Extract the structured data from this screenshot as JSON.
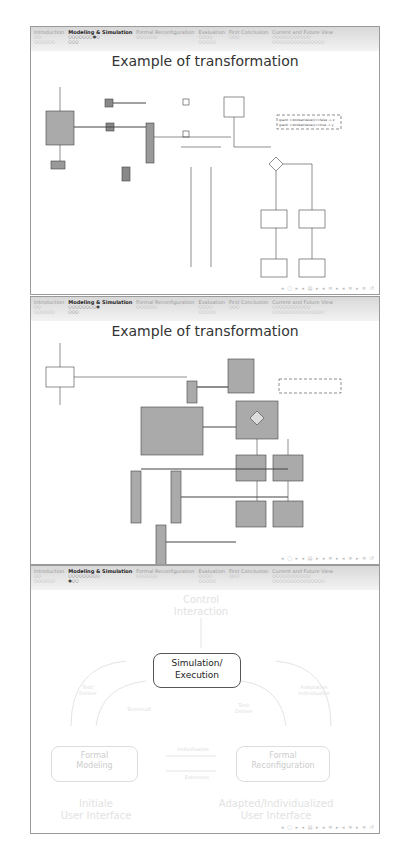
{
  "sections": [
    {
      "label": "Introduction",
      "dots": [
        "○○",
        "○○○○○○"
      ]
    },
    {
      "label": "Modeling & Simulation",
      "dots": [
        "○○○○○○○○",
        "○○○"
      ]
    },
    {
      "label": "Formal Reconfiguration",
      "dots": [
        "○○○○○○"
      ]
    },
    {
      "label": "Evaluation",
      "dots": [
        "○○○○",
        "○○○○○"
      ]
    },
    {
      "label": "First Conclusion",
      "dots": [
        "○○○"
      ]
    },
    {
      "label": "Current and Future View",
      "dots": [
        "○○○○○○○○○○○",
        "○○○○○○○○○○○○○○○"
      ]
    }
  ],
  "slides": [
    {
      "active_section": "Modeling & Simulation",
      "active_dots": [
        "○○○○○○○●○",
        "○○○"
      ],
      "title": "Example of transformation",
      "nav": "◂ ▢ ▸ ◂ ▤ ▸ ◂ ≡ ▸ ◂ ≡ ▸ ≡ ↺"
    },
    {
      "active_section": "Modeling & Simulation",
      "active_dots": [
        "○○○○○○○○●",
        "○○○"
      ],
      "title": "Example of transformation",
      "nav": "◂ ▢ ▸ ◂ ▤ ▸ ◂ ≡ ▸ ◂ ≡ ▸ ≡ ↺"
    },
    {
      "active_section": "Modeling & Simulation",
      "active_dots": [
        "○○○○○○○○○",
        "●○○"
      ],
      "cycle": {
        "control": "Control\nInteraction",
        "center": "Simulation/\nExecution",
        "test_deliver_left": "Test/\nDeliver",
        "test_deliver_right": "Test/\nDeliver",
        "adaptation": "Adaptation\nIndividualize",
        "testresult": "Testresult",
        "individualize": "Individualize",
        "extension": "Extension",
        "formal_modeling": "Formal\nModeling",
        "formal_reconfiguration": "Formal\nReconfiguration",
        "initial_ui": "Initiale\nUser Interface",
        "adapted_ui": "Adapted/Individualized\nUser Interface"
      },
      "nav": "◂ ▢ ▸ ◂ ▤ ▸ ◂ ≡ ▸ ◂ ≡ ▸ ≡ ↺"
    }
  ],
  "diagram_labels": {
    "guard_true": "guard: x.booleanValue()==true -> y;",
    "guard_false": "guard: x.booleanValue()==false -> z;",
    "a": "a",
    "b": "b",
    "transition": "getValue",
    "place": "Event"
  }
}
